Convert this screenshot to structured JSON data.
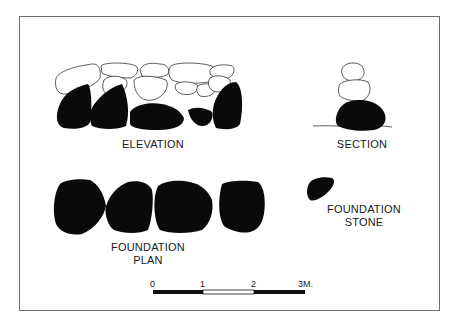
{
  "figure": {
    "labels": {
      "elevation": "ELEVATION",
      "section": "SECTION",
      "foundation_plan_line1": "FOUNDATION",
      "foundation_plan_line2": "PLAN",
      "foundation_stone_line1": "FOUNDATION",
      "foundation_stone_line2": "STONE"
    },
    "scale_bar": {
      "ticks": [
        "0",
        "1",
        "2",
        "3M."
      ],
      "segments": [
        {
          "from": 0,
          "to": 1,
          "fill": "#111111"
        },
        {
          "from": 1,
          "to": 2,
          "fill": "#ffffff"
        },
        {
          "from": 2,
          "to": 3,
          "fill": "#111111"
        }
      ],
      "unit": "M."
    },
    "colors": {
      "stone_fill": "#0a0a0a",
      "outline": "#333333",
      "frame": "#6d6d6d",
      "background": "#ffffff"
    }
  }
}
